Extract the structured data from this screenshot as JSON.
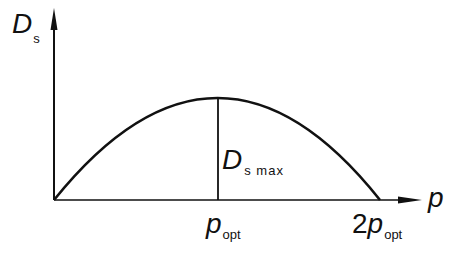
{
  "diagram": {
    "y_axis_label": {
      "main": "D",
      "sub": "s"
    },
    "x_axis_label": "p",
    "peak_label": {
      "main": "D",
      "sub": "s max"
    },
    "x_ticks": [
      {
        "prefix": "",
        "main": "p",
        "sub": "opt"
      },
      {
        "prefix": "2",
        "main": "p",
        "sub": "opt"
      }
    ],
    "curve": "parabola from origin through maximum at p_opt back to zero at 2 p_opt",
    "line_color": "#111111"
  }
}
